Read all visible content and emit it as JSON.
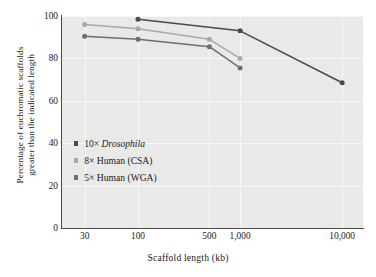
{
  "chart_data": {
    "type": "line",
    "title": "",
    "xlabel": "Scaffold length (kb)",
    "ylabel": "Percentage of euchromatic scaffolds\ngreater than the indicated length",
    "xscale": "log",
    "xticks": [
      30,
      100,
      500,
      1000,
      10000
    ],
    "xtick_labels": [
      "30",
      "100",
      "500",
      "1,000",
      "10,000"
    ],
    "yticks": [
      0,
      20,
      40,
      60,
      80,
      100
    ],
    "ytick_labels": [
      "0",
      "20",
      "40",
      "60",
      "80",
      "100"
    ],
    "ylim": [
      0,
      100
    ],
    "xlim": [
      18,
      16000
    ],
    "grid": true,
    "legend_position": "inside-left",
    "series": [
      {
        "name": "10× Drosophila",
        "name_plain": "10× Drosophila",
        "prefix": "10× ",
        "italic_part": "Drosophila",
        "suffix": "",
        "color": "#4a4a4a",
        "x": [
          100,
          1000,
          10000
        ],
        "y": [
          98.5,
          93,
          68.5
        ]
      },
      {
        "name": "8× Human (CSA)",
        "prefix": "8× Human (CSA)",
        "italic_part": "",
        "suffix": "",
        "color": "#a8a8a8",
        "x": [
          30,
          100,
          500,
          1000
        ],
        "y": [
          96,
          94,
          89,
          80
        ]
      },
      {
        "name": "5× Human (WGA)",
        "prefix": "5× Human (WGA)",
        "italic_part": "",
        "suffix": "",
        "color": "#6e6e6e",
        "x": [
          30,
          100,
          500,
          1000
        ],
        "y": [
          90.5,
          89,
          85.5,
          75.5
        ]
      }
    ],
    "plot_background": "#e9e9e7",
    "grid_color": "#f7f7f5",
    "axis_color": "#4a4a4a"
  }
}
